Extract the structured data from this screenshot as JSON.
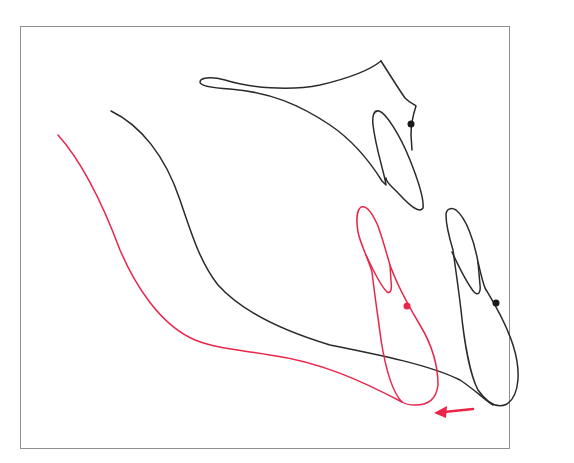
{
  "diagram": {
    "type": "cephalometric tracing overlay",
    "colors": {
      "original": "#2a2a2a",
      "shifted": "#e8264a",
      "frame": "#8f8f8f"
    },
    "elements": [
      {
        "name": "maxilla-outline",
        "color": "black"
      },
      {
        "name": "upper-incisor",
        "color": "black",
        "landmark_dot": true
      },
      {
        "name": "soft-tissue-profile-original",
        "color": "black"
      },
      {
        "name": "lower-incisor-original",
        "color": "black",
        "landmark_dot": true
      },
      {
        "name": "soft-tissue-profile-shifted",
        "color": "red"
      },
      {
        "name": "lower-incisor-shifted",
        "color": "red",
        "landmark_dot": true
      },
      {
        "name": "movement-arrow",
        "color": "red",
        "direction": "left"
      }
    ]
  }
}
